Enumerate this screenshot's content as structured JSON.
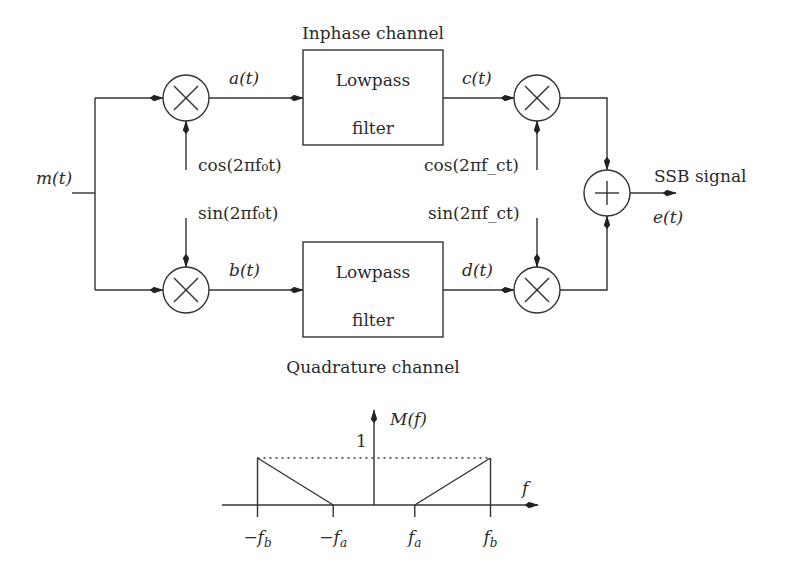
{
  "diagram": {
    "title_top": "Inphase channel",
    "title_bottom": "Quadrature channel",
    "input_label": "m(t)",
    "output_label": "SSB signal",
    "output_signal": "e(t)",
    "blocks": {
      "lpf_top": {
        "line1": "Lowpass",
        "line2": "filter"
      },
      "lpf_bottom": {
        "line1": "Lowpass",
        "line2": "filter"
      }
    },
    "signals": {
      "a": "a(t)",
      "b": "b(t)",
      "c": "c(t)",
      "d": "d(t)"
    },
    "oscillators": {
      "cos_f0": "cos(2πf₀t)",
      "sin_f0": "sin(2πf₀t)",
      "cos_fc": "cos(2πf_ct)",
      "sin_fc": "sin(2πf_ct)"
    },
    "operators": {
      "multiply": "×",
      "add": "+"
    }
  },
  "spectrum": {
    "ylabel": "M(f)",
    "xlabel": "f",
    "level_label": "1",
    "level": 1,
    "ticks": [
      "-f_b",
      "-f_a",
      "f_a",
      "f_b"
    ],
    "tick_values": {
      "neg_fb": -1,
      "neg_fa": -0.35,
      "fa": 0.35,
      "fb": 1
    },
    "shape": [
      {
        "f": -1,
        "m": 1
      },
      {
        "f": -0.35,
        "m": 0
      },
      {
        "f": 0.35,
        "m": 0
      },
      {
        "f": 1,
        "m": 1
      }
    ]
  }
}
